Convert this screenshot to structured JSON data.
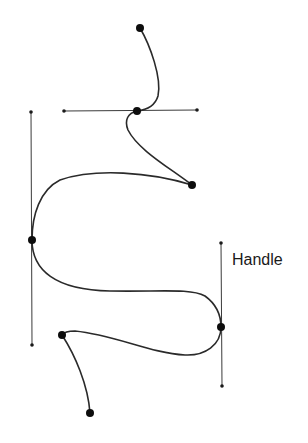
{
  "diagram": {
    "labels": {
      "handle": "Handle"
    },
    "anchor_points": [
      {
        "id": "p1",
        "x": 140,
        "y": 28
      },
      {
        "id": "p2",
        "x": 137,
        "y": 111
      },
      {
        "id": "p3",
        "x": 192,
        "y": 185
      },
      {
        "id": "p4",
        "x": 32,
        "y": 240
      },
      {
        "id": "p5",
        "x": 221,
        "y": 327
      },
      {
        "id": "p6",
        "x": 62,
        "y": 335
      },
      {
        "id": "p7",
        "x": 90,
        "y": 413
      }
    ],
    "handles": [
      {
        "id": "h-horizontal",
        "x1": 64,
        "y1": 111,
        "x2": 197,
        "y2": 110
      },
      {
        "id": "h-left-vertical",
        "x1": 31,
        "y1": 112,
        "x2": 32,
        "y2": 345
      },
      {
        "id": "h-right-vertical",
        "x1": 221,
        "y1": 243,
        "x2": 222,
        "y2": 386
      }
    ],
    "colors": {
      "stroke": "#2a2a2a",
      "point": "#0d0d0d",
      "background": "#ffffff"
    }
  }
}
